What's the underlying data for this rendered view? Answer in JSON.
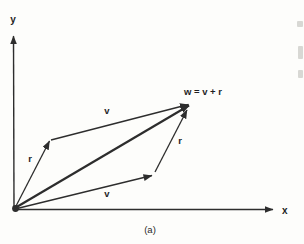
{
  "figure": {
    "caption": "(a)",
    "axes": {
      "x_label": "x",
      "y_label": "y"
    },
    "labels": {
      "r_left": "r",
      "v_upper": "v",
      "w": "w = v + r",
      "r_right": "r",
      "v_lower": "v"
    },
    "colors": {
      "line": "#2d2d2d",
      "background": "#fdfdfb",
      "text": "#1f1f1f"
    }
  }
}
